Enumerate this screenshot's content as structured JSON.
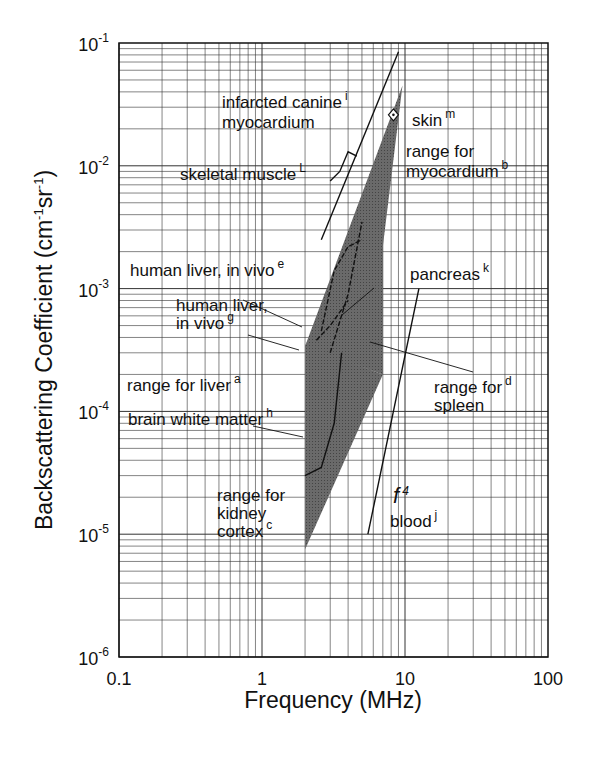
{
  "chart_data": {
    "type": "line",
    "title": "",
    "xlabel": "Frequency (MHz)",
    "ylabel": "Backscattering Coefficient (cm-1sr-1)",
    "xscale": "log",
    "yscale": "log",
    "xlim": [
      0.1,
      100
    ],
    "ylim": [
      1e-06,
      0.1
    ],
    "grid": true,
    "x_ticks": [
      "0.1",
      "1",
      "10",
      "100"
    ],
    "y_ticks": [
      {
        "base": "10",
        "exp": "-6",
        "value": 1e-06
      },
      {
        "base": "10",
        "exp": "-5",
        "value": 1e-05
      },
      {
        "base": "10",
        "exp": "-4",
        "value": 0.0001
      },
      {
        "base": "10",
        "exp": "-3",
        "value": 0.001
      },
      {
        "base": "10",
        "exp": "-2",
        "value": 0.01
      },
      {
        "base": "10",
        "exp": "-1",
        "value": 0.1
      }
    ],
    "regions": [
      {
        "name": "range for myocardium",
        "ref": "b",
        "type": "shaded_band",
        "polygon": [
          [
            2.0,
            0.00034
          ],
          [
            9.6,
            0.045
          ],
          [
            7.0,
            0.0022
          ],
          [
            7.0,
            0.0002
          ]
        ]
      },
      {
        "name": "range for liver",
        "ref": "a",
        "type": "shaded_band",
        "upper": [
          [
            1.0,
            0.00018
          ],
          [
            2.0,
            0.00034
          ],
          [
            3.0,
            0.0006
          ]
        ],
        "lower": [
          [
            1.0,
            0.00013
          ],
          [
            2.0,
            0.00022
          ],
          [
            3.0,
            0.0003
          ]
        ]
      },
      {
        "name": "range for kidney cortex",
        "ref": "c",
        "type": "shaded_band",
        "polygon": [
          [
            2.0,
            0.00035
          ],
          [
            2.0,
            7.5e-06
          ],
          [
            7.0,
            0.0002
          ]
        ]
      },
      {
        "name": "range for spleen",
        "ref": "d",
        "type": "shaded_band",
        "polygon": [
          [
            2.5,
            0.0006
          ],
          [
            7.0,
            0.0022
          ],
          [
            7.0,
            0.0002
          ]
        ]
      }
    ],
    "series": [
      {
        "name": "infarcted canine myocardium",
        "ref": "i",
        "type": "line",
        "points": [
          [
            2.6,
            0.0025
          ],
          [
            9.0,
            0.085
          ]
        ]
      },
      {
        "name": "skeletal muscle",
        "ref": "L",
        "type": "line",
        "points": [
          [
            3.0,
            0.0075
          ],
          [
            3.5,
            0.009
          ],
          [
            4.0,
            0.013
          ],
          [
            4.6,
            0.012
          ]
        ]
      },
      {
        "name": "skin",
        "ref": "m",
        "type": "point",
        "points": [
          [
            8.3,
            0.026
          ]
        ]
      },
      {
        "name": "human liver, in vivo",
        "ref": "e",
        "type": "line",
        "points": [
          [
            2.6,
            0.00045
          ],
          [
            3.2,
            0.0014
          ],
          [
            4.0,
            0.0022
          ],
          [
            5.0,
            0.0025
          ]
        ]
      },
      {
        "name": "human liver, in vivo",
        "ref": "g",
        "type": "line",
        "points": [
          [
            2.4,
            0.00038
          ],
          [
            3.0,
            0.0005
          ],
          [
            4.0,
            0.0008
          ]
        ]
      },
      {
        "name": "pancreas",
        "ref": "k",
        "type": "line",
        "points": [
          [
            3.0,
            0.0003
          ],
          [
            4.0,
            0.0009
          ],
          [
            5.0,
            0.0035
          ]
        ]
      },
      {
        "name": "brain white matter",
        "ref": "h",
        "type": "line",
        "points": [
          [
            2.0,
            3e-05
          ],
          [
            2.6,
            3.5e-05
          ],
          [
            3.2,
            8e-05
          ],
          [
            3.6,
            0.0003
          ]
        ]
      },
      {
        "name": "blood",
        "ref": "j",
        "type": "line",
        "note": "f^4",
        "points": [
          [
            5.5,
            1e-05
          ],
          [
            12.5,
            0.001
          ]
        ]
      }
    ],
    "annotations": [
      {
        "text": "infarcted canine",
        "sup": "i"
      },
      {
        "text": "myocardium"
      },
      {
        "text": "skin",
        "sup": "m"
      },
      {
        "text": "skeletal muscle",
        "sup": "L"
      },
      {
        "text": "range for"
      },
      {
        "text": "myocardium",
        "sup": "b"
      },
      {
        "text": "human liver, in vivo",
        "sup": "e"
      },
      {
        "text": "pancreas",
        "sup": "k"
      },
      {
        "text": "human liver,"
      },
      {
        "text": "in vivo",
        "sup": "g"
      },
      {
        "text": "range for",
        "sup": "d"
      },
      {
        "text": "spleen"
      },
      {
        "text": "range for liver",
        "sup": "a"
      },
      {
        "text": "brain white matter",
        "sup": "h"
      },
      {
        "text": "range for"
      },
      {
        "text": "kidney"
      },
      {
        "text": "cortex",
        "sup": "c"
      },
      {
        "text": "f",
        "sup": "4"
      },
      {
        "text": "blood",
        "sup": "j"
      }
    ]
  },
  "labels": {
    "xlabel": "Frequency (MHz)",
    "ylabel_main": "Backscattering Coefficient (cm",
    "ylabel_sup1": "-1",
    "ylabel_mid": "sr",
    "ylabel_sup2": "-1",
    "ylabel_end": ")"
  },
  "colors": {
    "band": "#5a5a5a",
    "line": "#111111",
    "grid": "#333333"
  }
}
